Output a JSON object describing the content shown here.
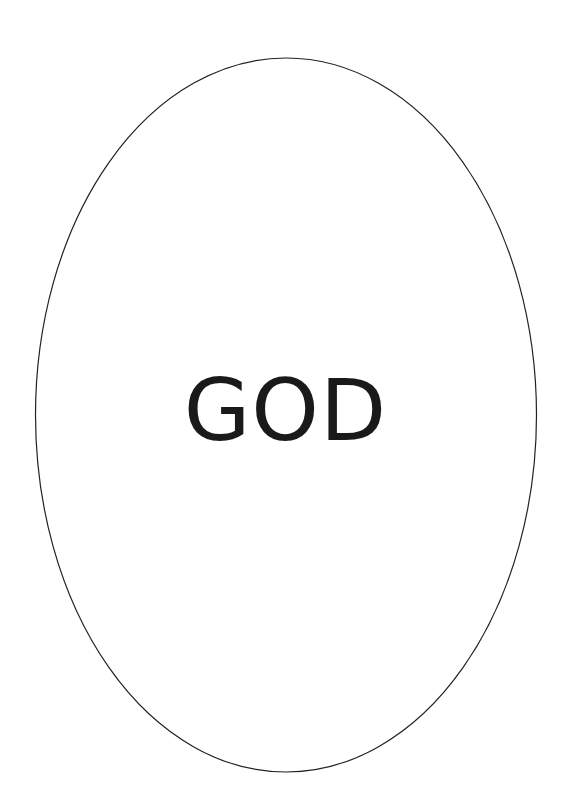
{
  "diagram": {
    "shape": "ellipse",
    "label": "GOD",
    "stroke_color": "#222222",
    "fill_color": "#ffffff",
    "text_color": "#1a1a1a"
  }
}
